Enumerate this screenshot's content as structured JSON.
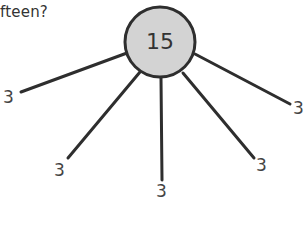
{
  "question": {
    "text": "fteen?"
  },
  "diagram": {
    "type": "part-whole",
    "center": {
      "label": "15",
      "fill": "#d3d3d3",
      "stroke": "#2e2e2e"
    },
    "line_color": "#2e2e2e",
    "parts": [
      {
        "label": "3",
        "position": "left"
      },
      {
        "label": "3",
        "position": "lower-left"
      },
      {
        "label": "3",
        "position": "bottom"
      },
      {
        "label": "3",
        "position": "lower-right"
      },
      {
        "label": "3",
        "position": "right"
      }
    ]
  }
}
